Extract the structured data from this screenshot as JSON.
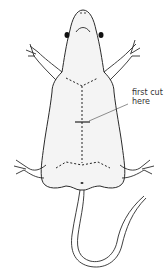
{
  "diagram": {
    "labels": {
      "first_cut_line1": "first cut",
      "first_cut_line2": "here"
    },
    "colors": {
      "outline": "#2b2b2b",
      "body_fill": "#f4f4f4",
      "cut_line": "#222222",
      "eye": "#111111"
    }
  }
}
